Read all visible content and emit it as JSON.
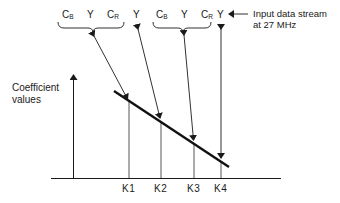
{
  "diagram": {
    "stream_samples": [
      {
        "main": "C",
        "sub": "B",
        "x": 62
      },
      {
        "main": "Y",
        "sub": "",
        "x": 87
      },
      {
        "main": "C",
        "sub": "R",
        "x": 107
      },
      {
        "main": "Y",
        "sub": "",
        "x": 133
      },
      {
        "main": "C",
        "sub": "B",
        "x": 156
      },
      {
        "main": "Y",
        "sub": "",
        "x": 181
      },
      {
        "main": "C",
        "sub": "R",
        "x": 201
      },
      {
        "main": "Y",
        "sub": "",
        "x": 217
      }
    ],
    "stream_label_line1": "Input data stream",
    "stream_label_line2": "at 27 MHz",
    "axis_label_line1": "Coefficient",
    "axis_label_line2": "values",
    "taps": [
      {
        "label": "K1",
        "x": 129
      },
      {
        "label": "K2",
        "x": 161
      },
      {
        "label": "K3",
        "x": 194
      },
      {
        "label": "K4",
        "x": 221
      }
    ],
    "colors": {
      "ink": "#1a1a1a",
      "background": "#ffffff"
    }
  }
}
